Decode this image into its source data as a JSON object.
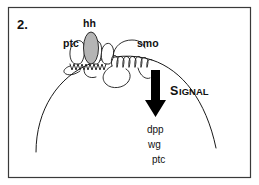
{
  "figure": {
    "panel_number": "2.",
    "caption_type": "hedgehog-signaling-diagram",
    "background_color": "#ffffff",
    "border_color": "#3a3a3a",
    "ink_color": "#1a1a1a"
  },
  "membrane": {
    "label": "cell-membrane-arc",
    "description": "large arc representing the receiving cell surface"
  },
  "proteins": [
    {
      "id": "ptc",
      "label": "ptc",
      "role": "receptor",
      "x": 63,
      "y": 46
    },
    {
      "id": "hh",
      "label": "hh",
      "role": "ligand",
      "fill_color": "#b5b5b5",
      "x": 88,
      "y": 27
    },
    {
      "id": "smo",
      "label": "smo",
      "role": "transducer",
      "x": 137,
      "y": 46
    }
  ],
  "signal": {
    "arrow_name": "signal-arrow",
    "cap_letter": "S",
    "rest_letters": "IGNAL"
  },
  "target_genes": {
    "heading": "",
    "items": [
      {
        "label": "dpp",
        "x": 147,
        "y": 132
      },
      {
        "label": "wg",
        "x": 148,
        "y": 147
      },
      {
        "label": "ptc",
        "x": 152,
        "y": 162
      }
    ]
  }
}
